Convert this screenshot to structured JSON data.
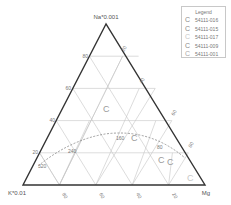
{
  "diagram": {
    "type": "ternary",
    "apex_labels": {
      "top": "Na*0.001",
      "left": "K*0.01",
      "right": "Mg"
    },
    "left_ticks": [
      "80",
      "60",
      "40",
      "20"
    ],
    "right_ticks": [
      "20",
      "40",
      "60",
      "80"
    ],
    "bottom_ticks": [
      "80",
      "60",
      "40",
      "20"
    ],
    "curve_labels": [
      "320",
      "240",
      "160",
      "80"
    ],
    "data_points": [
      {
        "x": 103,
        "y": 112,
        "symbol": "C",
        "color": "#9a9a9a"
      },
      {
        "x": 133,
        "y": 140,
        "symbol": "C",
        "color": "#9a9a9a"
      },
      {
        "x": 160,
        "y": 161,
        "symbol": "C",
        "color": "#9a9a9a"
      },
      {
        "x": 168,
        "y": 163,
        "symbol": "C",
        "color": "#9a9a9a"
      },
      {
        "x": 189,
        "y": 178,
        "symbol": "C",
        "color": "#c8c8c8"
      }
    ],
    "colors": {
      "frame": "#333333",
      "grid": "#c4c4c4",
      "curve": "#888888"
    }
  },
  "legend": {
    "title": "Legend",
    "items": [
      {
        "symbol": "C",
        "label": "54111-016",
        "color": "#8a8a8a"
      },
      {
        "symbol": "C",
        "label": "54111-015",
        "color": "#8a8a8a"
      },
      {
        "symbol": "C",
        "label": "54111-017",
        "color": "#c8c8c8"
      },
      {
        "symbol": "C",
        "label": "54111-009",
        "color": "#8a8a8a"
      },
      {
        "symbol": "C",
        "label": "54111-001",
        "color": "#a8a8a8"
      }
    ]
  }
}
